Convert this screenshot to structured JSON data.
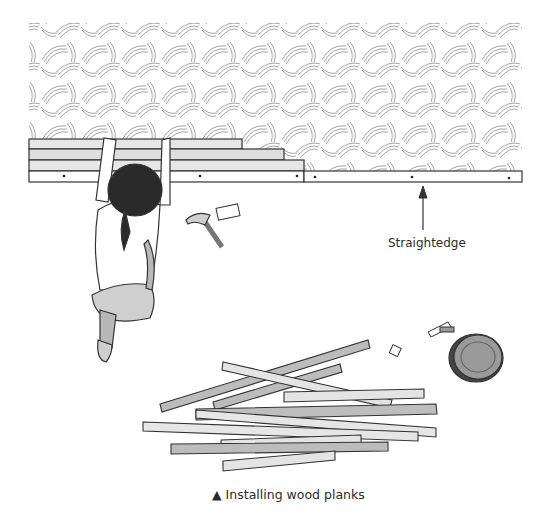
{
  "figure": {
    "callout_label": "Straightedge",
    "caption_marker": "▲",
    "caption_text": "Installing wood planks"
  },
  "colors": {
    "line": "#333333",
    "wood_light": "#e8e8e8",
    "wood_dark": "#b5b5b5",
    "hair": "#2a2a2a",
    "shirt": "#ffffff",
    "pants": "#cfcfcf",
    "paint_can": "#9a9a9a"
  }
}
